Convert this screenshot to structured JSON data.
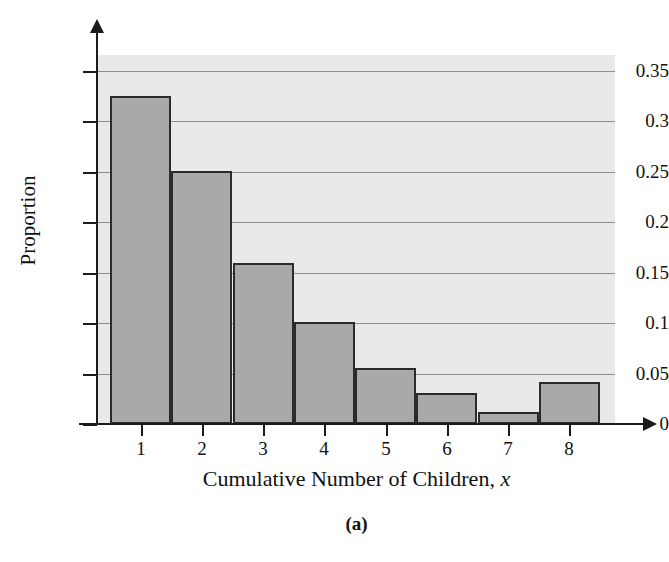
{
  "figure": {
    "caption": "(a)"
  },
  "chart_data": {
    "type": "bar",
    "title": "",
    "xlabel_main": "Cumulative Number of Children,",
    "xlabel_italic": "x",
    "ylabel": "Proportion",
    "categories": [
      "1",
      "2",
      "3",
      "4",
      "5",
      "6",
      "7",
      "8"
    ],
    "values": [
      0.325,
      0.251,
      0.16,
      0.101,
      0.056,
      0.031,
      0.012,
      0.042
    ],
    "ylim": [
      0,
      0.37
    ],
    "xlim": [
      0.5,
      8.5
    ],
    "ytick_labels": [
      "0",
      "0.05",
      "0.1",
      "0.15",
      "0.2",
      "0.25",
      "0.3",
      "0.35"
    ],
    "ytick_values": [
      0,
      0.05,
      0.1,
      0.15,
      0.2,
      0.25,
      0.3,
      0.35
    ],
    "grid": true,
    "legend": "none",
    "colors": {
      "bar_fill": "#a9a9a9",
      "bar_edge": "#2b2b2b",
      "plot_background": "#e9e9e9",
      "gridline": "#8e8e8e",
      "axis": "#1b1b1b",
      "page_background": "#ffffff",
      "text": "#111111"
    }
  }
}
